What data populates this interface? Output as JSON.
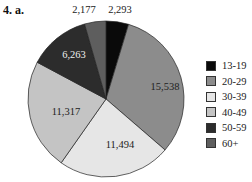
{
  "title": "4. a.",
  "chart_data": {
    "type": "pie",
    "title": "4. a.",
    "categories": [
      "13-19",
      "20-29",
      "30-39",
      "40-49",
      "50-59",
      "60+"
    ],
    "values": [
      2293,
      15538,
      11494,
      11317,
      6263,
      2177
    ],
    "colors": [
      "#0a0a0a",
      "#8c8c8c",
      "#e6e6e6",
      "#c4c4c4",
      "#2c2c2c",
      "#5e5e5e"
    ],
    "legend_position": "right"
  },
  "legend": [
    {
      "label": "13-19",
      "color": "#0a0a0a"
    },
    {
      "label": "20-29",
      "color": "#8c8c8c"
    },
    {
      "label": "30-39",
      "color": "#e6e6e6"
    },
    {
      "label": "40-49",
      "color": "#c4c4c4"
    },
    {
      "label": "50-59",
      "color": "#2c2c2c"
    },
    {
      "label": "60+",
      "color": "#5e5e5e"
    }
  ],
  "labels": [
    "2,293",
    "15,538",
    "11,494",
    "11,317",
    "6,263",
    "2,177"
  ]
}
